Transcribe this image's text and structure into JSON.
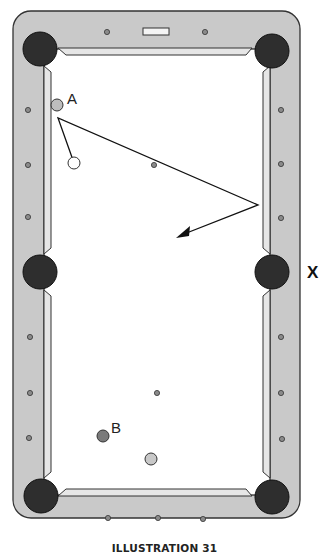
{
  "diagram": {
    "caption": "ILLUSTRATION 31",
    "labels": {
      "ball_a": "A",
      "ball_b": "B",
      "side_marker": "X"
    },
    "colors": {
      "rail": "#c9c9c9",
      "cushion": "#e2e2e2",
      "felt": "#ffffff",
      "pocket": "#2e2e2e",
      "diamond": "#8a8a8a",
      "ball_a": "#bdbdbd",
      "ball_b": "#7a7a7a",
      "ball_light": "#c8c8c8",
      "cue_ball": "#ffffff",
      "line": "#111111"
    },
    "balls": [
      {
        "id": "A",
        "cx": 57,
        "cy": 105,
        "r": 6
      },
      {
        "id": "cue",
        "cx": 74,
        "cy": 163,
        "r": 6
      },
      {
        "id": "B",
        "cx": 103,
        "cy": 436,
        "r": 6
      },
      {
        "id": "light",
        "cx": 151,
        "cy": 459,
        "r": 6
      }
    ],
    "shot_path": {
      "points": [
        [
          74,
          163
        ],
        [
          58,
          118
        ],
        [
          258,
          205
        ],
        [
          180,
          236
        ]
      ],
      "arrowhead": "end"
    }
  }
}
